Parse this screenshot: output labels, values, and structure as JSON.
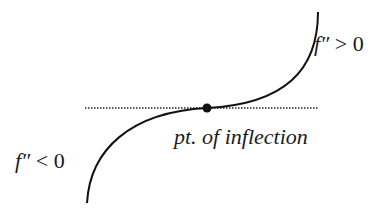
{
  "diagram": {
    "labels": {
      "concave_up": {
        "func": "f″",
        "rel": " > 0"
      },
      "concave_down": {
        "func": "f″",
        "rel": " < 0"
      },
      "inflection": "pt. of inflection"
    },
    "colors": {
      "curve": "#111111",
      "tangent": "#222222",
      "point": "#111111",
      "background": "#ffffff"
    }
  }
}
